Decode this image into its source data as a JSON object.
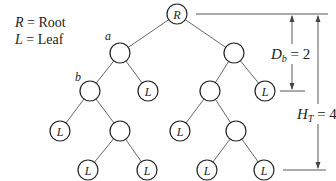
{
  "legend": {
    "items": [
      {
        "symbol": "R",
        "eq": " = ",
        "meaning": "Root"
      },
      {
        "symbol": "L",
        "eq": " = ",
        "meaning": "Leaf"
      }
    ]
  },
  "tree": {
    "nodes": [
      {
        "id": "root",
        "label": "R",
        "x": 177,
        "y": 14
      },
      {
        "id": "a",
        "label": "",
        "tag": "a",
        "x": 120,
        "y": 53
      },
      {
        "id": "r1",
        "label": "",
        "x": 234,
        "y": 53
      },
      {
        "id": "b",
        "label": "",
        "tag": "b",
        "x": 90,
        "y": 91
      },
      {
        "id": "l1",
        "label": "L",
        "x": 148,
        "y": 91
      },
      {
        "id": "r2",
        "label": "",
        "x": 210,
        "y": 91
      },
      {
        "id": "l2",
        "label": "L",
        "x": 265,
        "y": 91
      },
      {
        "id": "l3",
        "label": "L",
        "x": 60,
        "y": 131
      },
      {
        "id": "n3",
        "label": "",
        "x": 120,
        "y": 131
      },
      {
        "id": "l4",
        "label": "L",
        "x": 180,
        "y": 131
      },
      {
        "id": "n4",
        "label": "",
        "x": 236,
        "y": 131
      },
      {
        "id": "l5",
        "label": "L",
        "x": 88,
        "y": 170
      },
      {
        "id": "l6",
        "label": "L",
        "x": 147,
        "y": 170
      },
      {
        "id": "l7",
        "label": "L",
        "x": 207,
        "y": 170
      },
      {
        "id": "l8",
        "label": "L",
        "x": 264,
        "y": 170
      }
    ],
    "node_tags": {
      "a": "a",
      "b": "b"
    }
  },
  "dimensions": {
    "depth": {
      "var": "D",
      "sub": "b",
      "eq": " = 2"
    },
    "height": {
      "var": "H",
      "sub": "T",
      "eq": " = 4"
    }
  }
}
